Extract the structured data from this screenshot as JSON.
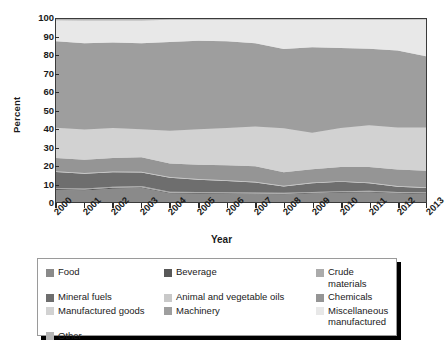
{
  "chart_data": {
    "type": "area",
    "stacked": true,
    "title": "",
    "xlabel": "Year",
    "ylabel": "Percent",
    "ylim": [
      0,
      100
    ],
    "xlim": [
      2000,
      2013
    ],
    "yticks": [
      0,
      10,
      20,
      30,
      40,
      50,
      60,
      70,
      80,
      90,
      100
    ],
    "grid": false,
    "legend_position": "below",
    "x": [
      2000,
      2001,
      2002,
      2003,
      2004,
      2005,
      2006,
      2007,
      2008,
      2009,
      2010,
      2011,
      2012,
      2013
    ],
    "categories": [
      "2000",
      "2001",
      "2002",
      "2003",
      "2004",
      "2005",
      "2006",
      "2007",
      "2008",
      "2009",
      "2010",
      "2011",
      "2012",
      "2013"
    ],
    "series": [
      {
        "name": "Food",
        "color": "#8a8a8a",
        "values": [
          6.6,
          6.3,
          7.3,
          7.6,
          4.7,
          4.5,
          4.4,
          4.3,
          4.1,
          4.6,
          5.0,
          5.2,
          4.6,
          4.4
        ]
      },
      {
        "name": "Beverage",
        "color": "#585858",
        "values": [
          0.5,
          0.5,
          0.5,
          0.5,
          0.4,
          0.4,
          0.4,
          0.4,
          0.4,
          0.4,
          0.4,
          0.4,
          0.4,
          0.4
        ]
      },
      {
        "name": "Crude materials",
        "color": "#ababab",
        "values": [
          0.6,
          0.6,
          0.6,
          0.6,
          0.5,
          0.5,
          0.5,
          0.5,
          0.5,
          0.5,
          0.5,
          0.5,
          0.5,
          0.5
        ]
      },
      {
        "name": "Mineral fuels",
        "color": "#6e6e6e",
        "values": [
          8.7,
          8.0,
          7.9,
          7.4,
          7.6,
          6.8,
          6.2,
          5.4,
          3.5,
          4.7,
          5.1,
          4.2,
          2.8,
          2.4
        ]
      },
      {
        "name": "Animal and vegetable oils",
        "color": "#c9c9c9",
        "values": [
          0.4,
          0.4,
          0.4,
          0.4,
          0.4,
          0.4,
          0.4,
          0.4,
          0.4,
          0.4,
          0.4,
          0.4,
          0.4,
          0.4
        ]
      },
      {
        "name": "Chemicals",
        "color": "#959595",
        "values": [
          7.2,
          7.3,
          7.4,
          8.0,
          7.4,
          7.7,
          8.2,
          8.5,
          7.4,
          7.3,
          7.7,
          8.4,
          9.0,
          9.0
        ]
      },
      {
        "name": "Manufactured goods",
        "color": "#d2d2d2",
        "values": [
          16.6,
          16.5,
          16.3,
          15.3,
          17.9,
          19.4,
          20.4,
          21.7,
          24.0,
          20.0,
          21.4,
          22.8,
          23.0,
          23.6
        ]
      },
      {
        "name": "Machinery",
        "color": "#9e9e9e",
        "values": [
          47.2,
          47.2,
          46.8,
          47.0,
          48.6,
          48.4,
          47.4,
          45.5,
          43.3,
          46.7,
          43.6,
          41.9,
          42.1,
          39.0
        ]
      },
      {
        "name": "Miscellaneous manufactured",
        "color": "#e8e8e8",
        "values": [
          11.5,
          12.4,
          12.0,
          12.4,
          12.1,
          11.5,
          11.7,
          12.9,
          16.0,
          15.0,
          15.6,
          15.8,
          16.8,
          20.0
        ]
      },
      {
        "name": "Other",
        "color": "#b5b5b5",
        "values": [
          0.7,
          0.8,
          0.8,
          0.8,
          0.4,
          0.4,
          0.4,
          0.4,
          0.4,
          0.4,
          0.3,
          0.4,
          0.4,
          0.3
        ]
      }
    ]
  },
  "axes": {
    "ylabel": "Percent",
    "xlabel": "Year",
    "yticks": [
      "100",
      "90",
      "80",
      "70",
      "60",
      "50",
      "40",
      "30",
      "20",
      "10",
      "0"
    ],
    "xticks": [
      "2000",
      "2001",
      "2002",
      "2003",
      "2004",
      "2005",
      "2006",
      "2007",
      "2008",
      "2009",
      "2010",
      "2011",
      "2012",
      "2013"
    ]
  },
  "legend": {
    "items": [
      {
        "label": "Food",
        "color": "#8a8a8a"
      },
      {
        "label": "Beverage",
        "color": "#585858"
      },
      {
        "label": "Crude materials",
        "color": "#ababab"
      },
      {
        "label": "Mineral fuels",
        "color": "#6e6e6e"
      },
      {
        "label": "Animal and vegetable oils",
        "color": "#c9c9c9"
      },
      {
        "label": "Chemicals",
        "color": "#959595"
      },
      {
        "label": "Manufactured goods",
        "color": "#d2d2d2"
      },
      {
        "label": "Machinery",
        "color": "#9e9e9e"
      },
      {
        "label": "Miscellaneous\nmanufactured",
        "color": "#e8e8e8"
      },
      {
        "label": "Other",
        "color": "#b5b5b5"
      }
    ]
  }
}
